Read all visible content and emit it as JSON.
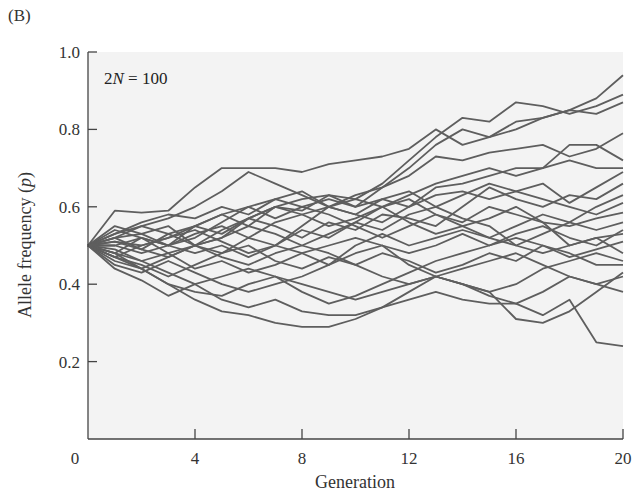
{
  "panel_label": "(B)",
  "colors": {
    "plot_background": "#f3f3f3",
    "line": "#5e5e5e",
    "axis": "#444444",
    "text": "#333333"
  },
  "chart_data": {
    "type": "line",
    "title": "",
    "panel": "(B)",
    "annotation": {
      "prefix": "2",
      "italic": "N",
      "suffix": " = 100"
    },
    "xlabel": "Generation",
    "ylabel_prefix": "Allele frequency (",
    "ylabel_italic": "p",
    "ylabel_suffix": ")",
    "xlim": [
      0,
      20
    ],
    "ylim": [
      0,
      1.0
    ],
    "xticks": [
      0,
      4,
      8,
      12,
      16,
      20
    ],
    "xtick_labels": [
      "0",
      "4",
      "8",
      "12",
      "16",
      "20"
    ],
    "yticks": [
      0.2,
      0.4,
      0.6,
      0.8,
      1.0
    ],
    "ytick_labels": [
      "0.2",
      "0.4",
      "0.6",
      "0.8",
      "1.0"
    ],
    "grid": false,
    "legend": null,
    "x": [
      0,
      1,
      2,
      3,
      4,
      5,
      6,
      7,
      8,
      9,
      10,
      11,
      12,
      13,
      14,
      15,
      16,
      17,
      18,
      19,
      20
    ],
    "series": [
      {
        "name": "Population 1",
        "values": [
          0.5,
          0.52,
          0.49,
          0.53,
          0.55,
          0.58,
          0.6,
          0.57,
          0.6,
          0.62,
          0.6,
          0.65,
          0.7,
          0.76,
          0.8,
          0.78,
          0.82,
          0.83,
          0.85,
          0.88,
          0.94
        ]
      },
      {
        "name": "Population 2",
        "values": [
          0.5,
          0.54,
          0.52,
          0.5,
          0.55,
          0.53,
          0.57,
          0.6,
          0.59,
          0.63,
          0.62,
          0.66,
          0.72,
          0.78,
          0.83,
          0.82,
          0.87,
          0.86,
          0.84,
          0.86,
          0.89
        ]
      },
      {
        "name": "Population 3",
        "values": [
          0.5,
          0.59,
          0.585,
          0.59,
          0.65,
          0.7,
          0.7,
          0.7,
          0.69,
          0.71,
          0.72,
          0.73,
          0.75,
          0.8,
          0.76,
          0.78,
          0.8,
          0.83,
          0.85,
          0.84,
          0.87
        ]
      },
      {
        "name": "Population 4",
        "values": [
          0.5,
          0.53,
          0.55,
          0.57,
          0.6,
          0.64,
          0.69,
          0.66,
          0.63,
          0.6,
          0.63,
          0.65,
          0.68,
          0.73,
          0.72,
          0.74,
          0.75,
          0.76,
          0.73,
          0.75,
          0.79
        ]
      },
      {
        "name": "Population 5",
        "values": [
          0.5,
          0.47,
          0.5,
          0.52,
          0.55,
          0.58,
          0.55,
          0.6,
          0.62,
          0.63,
          0.6,
          0.62,
          0.6,
          0.65,
          0.66,
          0.68,
          0.7,
          0.7,
          0.76,
          0.76,
          0.72
        ]
      },
      {
        "name": "Population 6",
        "values": [
          0.5,
          0.5,
          0.48,
          0.5,
          0.53,
          0.55,
          0.52,
          0.56,
          0.58,
          0.6,
          0.58,
          0.56,
          0.6,
          0.63,
          0.64,
          0.62,
          0.64,
          0.66,
          0.61,
          0.65,
          0.69
        ]
      },
      {
        "name": "Population 7",
        "values": [
          0.5,
          0.52,
          0.53,
          0.55,
          0.5,
          0.52,
          0.57,
          0.55,
          0.52,
          0.56,
          0.54,
          0.58,
          0.57,
          0.55,
          0.6,
          0.65,
          0.62,
          0.6,
          0.63,
          0.62,
          0.66
        ]
      },
      {
        "name": "Population 8",
        "values": [
          0.5,
          0.48,
          0.52,
          0.5,
          0.48,
          0.5,
          0.47,
          0.5,
          0.54,
          0.52,
          0.56,
          0.54,
          0.58,
          0.6,
          0.63,
          0.66,
          0.64,
          0.62,
          0.6,
          0.58,
          0.61
        ]
      },
      {
        "name": "Population 9",
        "values": [
          0.5,
          0.55,
          0.53,
          0.5,
          0.52,
          0.56,
          0.6,
          0.62,
          0.6,
          0.58,
          0.55,
          0.52,
          0.55,
          0.58,
          0.56,
          0.6,
          0.58,
          0.56,
          0.55,
          0.57,
          0.585
        ]
      },
      {
        "name": "Population 10",
        "values": [
          0.5,
          0.46,
          0.44,
          0.47,
          0.5,
          0.48,
          0.52,
          0.5,
          0.48,
          0.45,
          0.5,
          0.53,
          0.5,
          0.52,
          0.54,
          0.52,
          0.55,
          0.58,
          0.56,
          0.54,
          0.56
        ]
      },
      {
        "name": "Population 11",
        "values": [
          0.5,
          0.51,
          0.5,
          0.52,
          0.54,
          0.51,
          0.48,
          0.5,
          0.55,
          0.6,
          0.62,
          0.6,
          0.56,
          0.53,
          0.55,
          0.57,
          0.6,
          0.56,
          0.5,
          0.52,
          0.53
        ]
      },
      {
        "name": "Population 12",
        "values": [
          0.5,
          0.49,
          0.46,
          0.48,
          0.44,
          0.46,
          0.43,
          0.45,
          0.48,
          0.5,
          0.52,
          0.5,
          0.48,
          0.5,
          0.53,
          0.5,
          0.52,
          0.5,
          0.47,
          0.49,
          0.51
        ]
      },
      {
        "name": "Population 13",
        "values": [
          0.5,
          0.53,
          0.56,
          0.58,
          0.57,
          0.6,
          0.58,
          0.62,
          0.64,
          0.6,
          0.58,
          0.62,
          0.64,
          0.6,
          0.57,
          0.55,
          0.5,
          0.48,
          0.5,
          0.52,
          0.48
        ]
      },
      {
        "name": "Population 14",
        "values": [
          0.5,
          0.47,
          0.45,
          0.42,
          0.45,
          0.48,
          0.5,
          0.46,
          0.44,
          0.47,
          0.45,
          0.48,
          0.46,
          0.43,
          0.45,
          0.48,
          0.46,
          0.5,
          0.48,
          0.45,
          0.45
        ]
      },
      {
        "name": "Population 15",
        "values": [
          0.5,
          0.45,
          0.43,
          0.46,
          0.43,
          0.4,
          0.38,
          0.4,
          0.42,
          0.45,
          0.48,
          0.5,
          0.45,
          0.42,
          0.4,
          0.38,
          0.31,
          0.3,
          0.33,
          0.38,
          0.43
        ]
      },
      {
        "name": "Population 16",
        "values": [
          0.5,
          0.5,
          0.52,
          0.48,
          0.5,
          0.52,
          0.55,
          0.53,
          0.5,
          0.48,
          0.45,
          0.42,
          0.4,
          0.42,
          0.44,
          0.46,
          0.48,
          0.45,
          0.42,
          0.4,
          0.42
        ]
      },
      {
        "name": "Population 17",
        "values": [
          0.5,
          0.48,
          0.44,
          0.4,
          0.38,
          0.37,
          0.4,
          0.42,
          0.4,
          0.38,
          0.36,
          0.38,
          0.4,
          0.42,
          0.4,
          0.37,
          0.35,
          0.38,
          0.42,
          0.4,
          0.38
        ]
      },
      {
        "name": "Population 18",
        "values": [
          0.5,
          0.48,
          0.46,
          0.43,
          0.4,
          0.36,
          0.34,
          0.36,
          0.33,
          0.32,
          0.32,
          0.34,
          0.36,
          0.38,
          0.36,
          0.35,
          0.35,
          0.32,
          0.36,
          0.25,
          0.24
        ]
      },
      {
        "name": "Population 19",
        "values": [
          0.5,
          0.47,
          0.44,
          0.4,
          0.36,
          0.33,
          0.32,
          0.3,
          0.29,
          0.29,
          0.31,
          0.34,
          0.38,
          0.42,
          0.4,
          0.38,
          0.4,
          0.44,
          0.46,
          0.48,
          0.46
        ]
      },
      {
        "name": "Population 20",
        "values": [
          0.5,
          0.44,
          0.41,
          0.37,
          0.4,
          0.42,
          0.44,
          0.42,
          0.38,
          0.35,
          0.37,
          0.4,
          0.43,
          0.46,
          0.48,
          0.5,
          0.53,
          0.55,
          0.52,
          0.5,
          0.54
        ]
      },
      {
        "name": "Population 21",
        "values": [
          0.5,
          0.52,
          0.55,
          0.53,
          0.5,
          0.47,
          0.45,
          0.48,
          0.5,
          0.53,
          0.56,
          0.6,
          0.62,
          0.58,
          0.55,
          0.52,
          0.5,
          0.53,
          0.56,
          0.6,
          0.63
        ]
      },
      {
        "name": "Population 22",
        "values": [
          0.5,
          0.51,
          0.49,
          0.47,
          0.5,
          0.54,
          0.57,
          0.6,
          0.58,
          0.55,
          0.57,
          0.6,
          0.63,
          0.66,
          0.68,
          0.7,
          0.68,
          0.7,
          0.72,
          0.7,
          0.7
        ]
      }
    ]
  }
}
